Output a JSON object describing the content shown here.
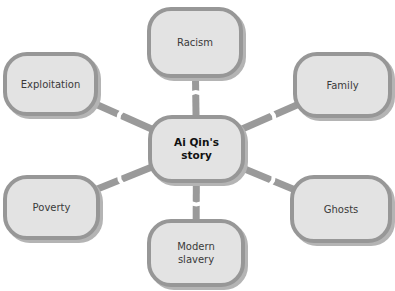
{
  "diagram": {
    "type": "mind-map",
    "colors": {
      "node_fill": "#e3e3e3",
      "node_border": "#979797",
      "connector": "#9a9a9a",
      "background": "#ffffff"
    },
    "center": {
      "id": "center",
      "label": "Ai Qin's\nstory"
    },
    "branches": [
      {
        "id": "racism",
        "label": "Racism"
      },
      {
        "id": "family",
        "label": "Family"
      },
      {
        "id": "ghosts",
        "label": "Ghosts"
      },
      {
        "id": "modern-slavery",
        "label": "Modern\nslavery"
      },
      {
        "id": "poverty",
        "label": "Poverty"
      },
      {
        "id": "exploitation",
        "label": "Exploitation"
      }
    ],
    "edges": [
      {
        "from": "center",
        "to": "racism"
      },
      {
        "from": "center",
        "to": "family"
      },
      {
        "from": "center",
        "to": "ghosts"
      },
      {
        "from": "center",
        "to": "modern-slavery"
      },
      {
        "from": "center",
        "to": "poverty"
      },
      {
        "from": "center",
        "to": "exploitation"
      }
    ]
  }
}
